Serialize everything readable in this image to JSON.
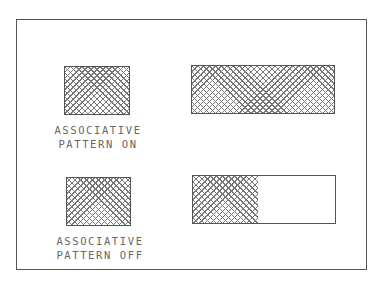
{
  "figure": {
    "panels": [
      {
        "id": "associative-on",
        "label_line1": "ASSOCIATIVE",
        "label_line2": "PATTERN ON",
        "original_hatch": "full",
        "stretched_hatch": "full"
      },
      {
        "id": "associative-off",
        "label_line1": "ASSOCIATIVE",
        "label_line2": "PATTERN OFF",
        "original_hatch": "full",
        "stretched_hatch": "partial"
      }
    ],
    "colors": {
      "line": "#555555",
      "hatch": "#777777",
      "text": "#666666"
    }
  }
}
